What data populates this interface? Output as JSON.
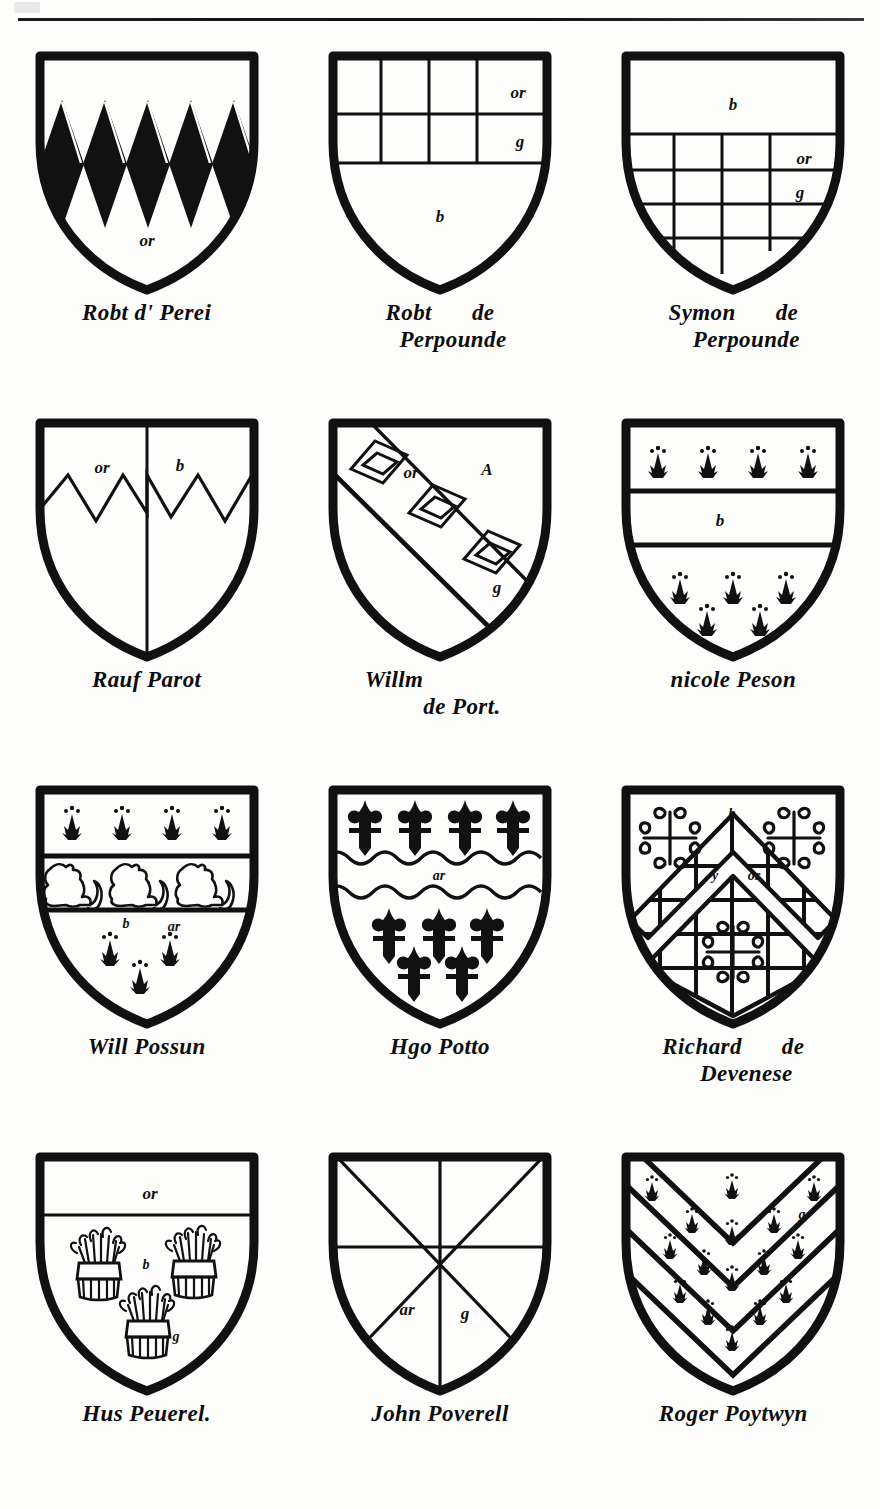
{
  "page": {
    "rule": "horizontal-rule",
    "columns": 3,
    "rows": 4
  },
  "shields": [
    {
      "id": "robt-d-perei",
      "name_lines": [
        "Robt d' Perei"
      ],
      "blazon_kind": "paly-lozengy-chief",
      "description": "Field with five black lozenges issuing from a plain chief",
      "tinctures": [
        {
          "label": "or",
          "x": 125,
          "y": 196
        }
      ]
    },
    {
      "id": "robt-de-perpounde",
      "name_lines": [
        "Robt",
        "de",
        "Perpounde"
      ],
      "blazon_kind": "checky-chief",
      "description": "Chief of two rows of checks over a plain field",
      "tinctures": [
        {
          "label": "or",
          "x": 203,
          "y": 47
        },
        {
          "label": "g",
          "x": 205,
          "y": 96
        },
        {
          "label": "b",
          "x": 125,
          "y": 170
        }
      ]
    },
    {
      "id": "symon-de-perpounde",
      "name_lines": [
        "Symon",
        "de",
        "Perpounde"
      ],
      "blazon_kind": "chief-plain-checky-base",
      "description": "Plain chief over a checky field",
      "tinctures": [
        {
          "label": "b",
          "x": 125,
          "y": 58
        },
        {
          "label": "or",
          "x": 198,
          "y": 120
        },
        {
          "label": "g",
          "x": 198,
          "y": 155
        }
      ]
    },
    {
      "id": "rauf-parot",
      "name_lines": [
        "Rauf Parot"
      ],
      "blazon_kind": "per-pale-indented",
      "description": "Per pale, a line indented across the upper field",
      "tinctures": [
        {
          "label": "or",
          "x": 82,
          "y": 56
        },
        {
          "label": "b",
          "x": 157,
          "y": 54
        }
      ]
    },
    {
      "id": "willm-de-port",
      "name_lines": [
        "Willm",
        "de Port."
      ],
      "blazon_kind": "bend-three-mascles",
      "description": "A bend charged with three mascles",
      "tinctures": [
        {
          "label": "or",
          "x": 96,
          "y": 60
        },
        {
          "label": "A",
          "x": 172,
          "y": 58
        },
        {
          "label": "g",
          "x": 182,
          "y": 172
        }
      ]
    },
    {
      "id": "nicole-peson",
      "name_lines": [
        "nicole Peson"
      ],
      "blazon_kind": "fess-between-ermine",
      "description": "A fess between four ermine spots in chief and five in base",
      "tinctures": [
        {
          "label": "b",
          "x": 115,
          "y": 110
        }
      ]
    },
    {
      "id": "will-possun",
      "name_lines": [
        "Will Possun"
      ],
      "blazon_kind": "fess-three-lions",
      "description": "A fess charged with three lions passant between ermine spots",
      "tinctures": [
        {
          "label": "b",
          "x": 106,
          "y": 143
        },
        {
          "label": "ar",
          "x": 150,
          "y": 147
        }
      ]
    },
    {
      "id": "hgo-potto",
      "name_lines": [
        "Hgo Potto"
      ],
      "blazon_kind": "fess-nebuly-fleurs",
      "description": "A fess nebuly between fleurs-de-lis",
      "tinctures": [
        {
          "label": "ar",
          "x": 124,
          "y": 110
        }
      ]
    },
    {
      "id": "richard-de-devenese",
      "name_lines": [
        "Richard",
        "de",
        "Devenese"
      ],
      "blazon_kind": "chevron-fretty-crosslets",
      "description": "A chevron fretty between three cross-crosslets",
      "tinctures": [
        {
          "label": "b",
          "x": 124,
          "y": 30
        },
        {
          "label": "y",
          "x": 107,
          "y": 95
        },
        {
          "label": "or",
          "x": 144,
          "y": 96
        }
      ]
    },
    {
      "id": "hus-peuerel",
      "name_lines": [
        "Hus Peuerel."
      ],
      "blazon_kind": "chief-three-garbs",
      "description": "A chief, and three garbs (wheat sheaves) in the field",
      "tinctures": [
        {
          "label": "or",
          "x": 128,
          "y": 46
        },
        {
          "label": "b",
          "x": 124,
          "y": 116
        },
        {
          "label": "g",
          "x": 152,
          "y": 188
        }
      ]
    },
    {
      "id": "john-poverell",
      "name_lines": [
        "John Poverell"
      ],
      "blazon_kind": "gyronny-of-eight",
      "description": "Gyronny of eight",
      "tinctures": [
        {
          "label": "ar",
          "x": 94,
          "y": 162
        },
        {
          "label": "g",
          "x": 150,
          "y": 166
        }
      ]
    },
    {
      "id": "roger-poytwyn",
      "name_lines": [
        "Roger Poytwyn"
      ],
      "blazon_kind": "chevronny-ermine",
      "description": "Chevronny of several pieces semy of ermine spots",
      "tinctures": [
        {
          "label": "g",
          "x": 191,
          "y": 68
        }
      ]
    }
  ]
}
